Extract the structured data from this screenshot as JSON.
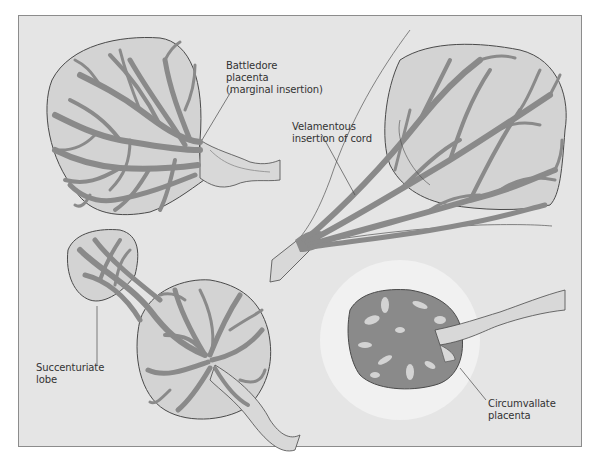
{
  "diagram": {
    "labels": {
      "battledore_line1": "Battledore",
      "battledore_line2": "placenta",
      "battledore_line3": "(marginal insertion)",
      "velamentous_line1": "Velamentous",
      "velamentous_line2": "insertion of cord",
      "succenturiate_line1": "Succenturiate",
      "succenturiate_line2": "lobe",
      "circumvallate_line1": "Circumvallate",
      "circumvallate_line2": "placenta"
    },
    "colors": {
      "background": "#e5e5e5",
      "placenta_fill": "#d3d3d3",
      "vessel": "#8a8a8a",
      "outline": "#4a4a4a",
      "halo": "#f2f2f2"
    }
  }
}
